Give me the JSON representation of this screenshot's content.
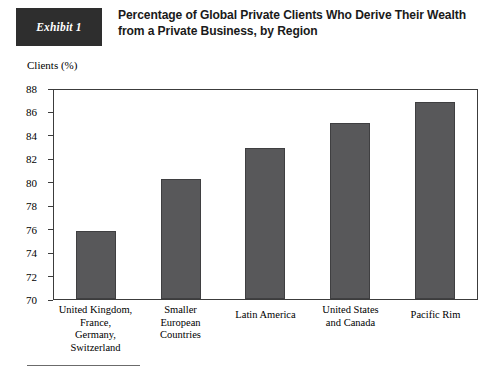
{
  "header": {
    "exhibit_label": "Exhibit 1",
    "title": "Percentage of Global Private Clients Who Derive Their Wealth\nfrom a Private Business, by Region",
    "exhibit_box_color": "#2e2e2e",
    "title_color": "#1a1a1a"
  },
  "chart_data": {
    "type": "bar",
    "title": "Percentage of Global Private Clients Who Derive Their Wealth from a Private Business, by Region",
    "ylabel": "Clients (%)",
    "xlabel": "",
    "categories": [
      "United Kingdom,\nFrance,\nGermany,\nSwitzerland",
      "Smaller\nEuropean\nCountries",
      "Latin America",
      "United States\nand Canada",
      "Pacific Rim"
    ],
    "values": [
      75.8,
      80.2,
      82.9,
      85.0,
      86.8
    ],
    "ylim": [
      70,
      88
    ],
    "yticks": [
      88,
      86,
      84,
      82,
      80,
      78,
      76,
      74,
      72,
      70
    ],
    "ytick_labels": [
      "88",
      "86",
      "84",
      "82",
      "80",
      "78",
      "76",
      "74",
      "72",
      "70"
    ],
    "grid": false,
    "legend": null,
    "bar_color": "#58585a",
    "axis_color": "#3c3c3c"
  },
  "footer": {
    "rule_visible": true
  }
}
